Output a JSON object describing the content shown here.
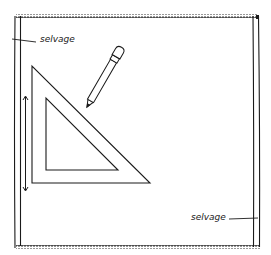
{
  "figure": {
    "stroke_color": "#1a1a1a",
    "background": "#ffffff"
  },
  "labels": {
    "selvage_top": "selvage",
    "selvage_bottom": "selvage"
  },
  "fabric": {
    "top_edge_y": 16,
    "bottom_edge_y": 247,
    "left_selvage_x": [
      15,
      20
    ],
    "right_selvage_x": [
      253,
      259
    ]
  },
  "set_square": {
    "outer": [
      [
        32,
        66
      ],
      [
        32,
        183
      ],
      [
        150,
        183
      ]
    ],
    "inner": [
      [
        46,
        98
      ],
      [
        46,
        170
      ],
      [
        118,
        170
      ]
    ]
  },
  "arrow": {
    "x": 25,
    "y_start": 97,
    "y_end": 190,
    "direction": "double"
  },
  "pencil": {
    "tip": [
      87,
      107
    ],
    "eraser_end": [
      122,
      45
    ]
  }
}
